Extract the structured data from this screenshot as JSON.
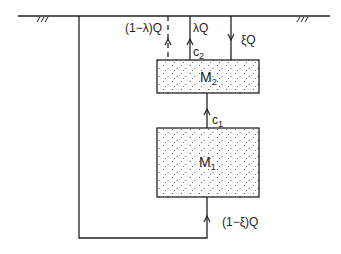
{
  "diagram": {
    "type": "two-compartment flow schematic",
    "colors": {
      "line": "#222222",
      "background": "#ffffff",
      "stipple": "#444444"
    },
    "compartments": [
      {
        "id": "M2",
        "label": "M",
        "subscript": "2"
      },
      {
        "id": "M1",
        "label": "M",
        "subscript": "1"
      }
    ],
    "flows": {
      "dashed_out": "(1−λ)Q",
      "lambda_out": "λQ",
      "xi_in": "ξQ",
      "bypass_in": "(1−ξ)Q"
    },
    "concentrations": {
      "c2": {
        "label": "c",
        "subscript": "2"
      },
      "c1": {
        "label": "c",
        "subscript": "1"
      }
    },
    "surface_marks": [
      "///",
      "///"
    ]
  }
}
